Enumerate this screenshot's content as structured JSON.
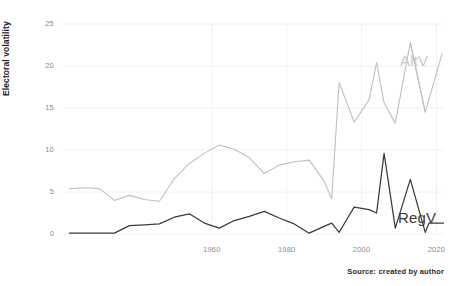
{
  "chart_data": {
    "type": "line",
    "title": "",
    "xlabel": "",
    "ylabel": "Electoral volatility",
    "xlim": [
      1920,
      2022
    ],
    "ylim": [
      0,
      25
    ],
    "grid": true,
    "legend_position": "inline-right",
    "yticks": [
      0,
      5,
      10,
      15,
      20,
      25
    ],
    "ytick_labels": [
      "0",
      "5",
      "10",
      "15",
      "20",
      "25"
    ],
    "xticks": [
      1960,
      1980,
      2000,
      2020
    ],
    "xtick_labels": [
      "1960",
      "1980",
      "2000",
      "2020"
    ],
    "caption": "Source: created by author",
    "colors": {
      "AltV": "#bfbfbf",
      "RegV": "#3a3a3a",
      "grid": "#f2f2f4",
      "background": "#ffffff",
      "axis_text": "#8a8a8a",
      "axis_title": "#1c1c1c"
    },
    "series": [
      {
        "name": "AltV",
        "label": "AltV",
        "color": "#bfbfbf",
        "x": [
          1922,
          1926,
          1930,
          1934,
          1938,
          1942,
          1946,
          1950,
          1954,
          1958,
          1962,
          1966,
          1970,
          1974,
          1978,
          1982,
          1986,
          1990,
          1992,
          1994,
          1996,
          1998,
          2002,
          2004,
          2006,
          2009,
          2013,
          2017
        ],
        "values": [
          5.4,
          5.5,
          5.4,
          4.0,
          4.6,
          4.1,
          3.9,
          6.6,
          8.4,
          9.6,
          10.6,
          10.1,
          9.1,
          7.2,
          8.2,
          8.6,
          8.8,
          6.3,
          4.2,
          18.0,
          15.7,
          13.3,
          16.0,
          20.4,
          15.6,
          13.2,
          22.8,
          14.5
        ]
      },
      {
        "name": "RegV",
        "label": "RegV",
        "color": "#3a3a3a",
        "x": [
          1922,
          1926,
          1930,
          1934,
          1938,
          1942,
          1946,
          1950,
          1954,
          1958,
          1962,
          1966,
          1970,
          1974,
          1978,
          1982,
          1986,
          1990,
          1992,
          1994,
          1996,
          1998,
          2002,
          2004,
          2006,
          2009,
          2013,
          2017
        ],
        "values": [
          0.1,
          0.1,
          0.1,
          0.1,
          1.0,
          1.1,
          1.2,
          2.0,
          2.4,
          1.3,
          0.7,
          1.6,
          2.1,
          2.7,
          1.9,
          1.2,
          0.1,
          0.9,
          1.3,
          0.2,
          1.7,
          3.2,
          2.9,
          2.5,
          9.6,
          0.7,
          6.5,
          0.2
        ]
      }
    ],
    "alt_series_tail": {
      "note_x": [
        2013,
        2017
      ],
      "note_values": [
        22.8,
        21.5
      ]
    },
    "reg_series_tail": {
      "note_x": [
        2013,
        2017
      ],
      "note_values": [
        1.3,
        1.3
      ]
    }
  },
  "labels": {
    "alt": "AltV",
    "reg": "RegV"
  }
}
